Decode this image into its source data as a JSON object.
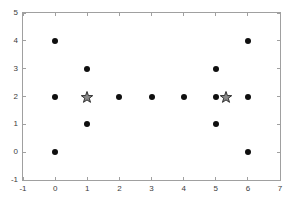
{
  "figure": {
    "background": "#ffffff"
  },
  "chart_data": {
    "type": "scatter",
    "title": "",
    "xlabel": "",
    "ylabel": "",
    "xlim": [
      -1,
      7
    ],
    "ylim": [
      -1,
      5
    ],
    "xticks": [
      -1,
      0,
      1,
      2,
      3,
      4,
      5,
      6,
      7
    ],
    "yticks": [
      -1,
      0,
      1,
      2,
      3,
      4,
      5
    ],
    "grid": false,
    "legend_position": "none",
    "axis_box_color": "#a0a0a0",
    "tick_label_color": "#3c3c3c",
    "series": [
      {
        "name": "data-points",
        "marker": "circle",
        "marker_size": 6,
        "color": "#0f0f0f",
        "points": [
          [
            0,
            0
          ],
          [
            0,
            2
          ],
          [
            0,
            4
          ],
          [
            1,
            1
          ],
          [
            1,
            3
          ],
          [
            2,
            2
          ],
          [
            3,
            2
          ],
          [
            4,
            2
          ],
          [
            5,
            1
          ],
          [
            5,
            2
          ],
          [
            5,
            3
          ],
          [
            6,
            0
          ],
          [
            6,
            2
          ],
          [
            6,
            4
          ]
        ]
      },
      {
        "name": "star-markers",
        "marker": "star",
        "marker_size": 12,
        "color": "#8a8a8a",
        "edge_color": "#2f2f2f",
        "points": [
          [
            1,
            2
          ],
          [
            5.33,
            2
          ]
        ]
      }
    ]
  }
}
